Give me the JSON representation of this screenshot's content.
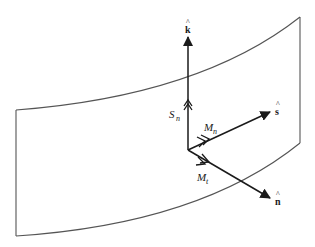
{
  "diagram": {
    "type": "surface-element-force-moment",
    "surface": {
      "description": "curved surface patch",
      "stroke_color": "#555555"
    },
    "unit_vectors": [
      {
        "id": "k",
        "label": "k",
        "hat": "^",
        "direction": "up"
      },
      {
        "id": "s",
        "label": "s",
        "hat": "^",
        "direction": "upper-right"
      },
      {
        "id": "n",
        "label": "n",
        "hat": "^",
        "direction": "lower-right"
      }
    ],
    "resultants": [
      {
        "id": "Sn",
        "symbol": "S",
        "subscript": "n",
        "along": "k"
      },
      {
        "id": "Mn",
        "symbol": "M",
        "subscript": "n",
        "along": "s"
      },
      {
        "id": "Mt",
        "symbol": "M",
        "subscript": "t",
        "along": "n"
      }
    ],
    "colors": {
      "vector": "#1a1a1a",
      "surface": "#555555",
      "background": "#ffffff"
    }
  }
}
